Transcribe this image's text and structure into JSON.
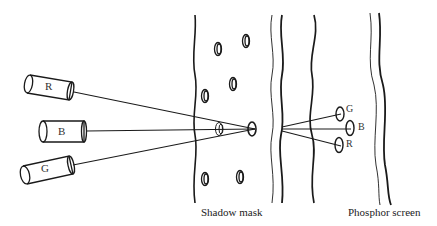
{
  "diagram": {
    "type": "shadow-mask CRT schematic",
    "electron_guns": [
      {
        "label": "R"
      },
      {
        "label": "B"
      },
      {
        "label": "G"
      }
    ],
    "phosphor_dots": [
      {
        "label": "G"
      },
      {
        "label": "B"
      },
      {
        "label": "R"
      }
    ],
    "labels": {
      "shadow_mask": "Shadow mask",
      "phosphor_screen": "Phosphor screen"
    },
    "colors": {
      "stroke": "#1a1a1a",
      "background": "#ffffff"
    }
  }
}
